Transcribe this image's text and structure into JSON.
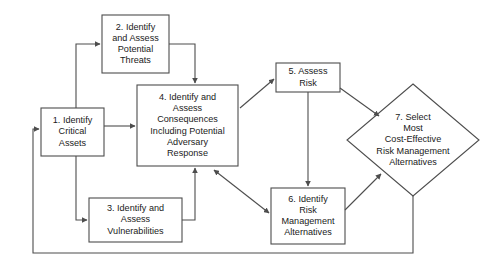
{
  "diagram": {
    "background_color": "#ffffff",
    "shape_stroke_color": "#4d4d4d",
    "text_color": "#1a1a1a",
    "nodes": [
      {
        "id": "node-1",
        "number": "1.",
        "name": "identify-critical-assets",
        "shape": "rectangle",
        "label": "1. Identify\nCritical\nAssets"
      },
      {
        "id": "node-2",
        "number": "2.",
        "name": "identify-assess-potential-threats",
        "shape": "rectangle",
        "label": "2. Identify\nand Assess\nPotential\nThreats"
      },
      {
        "id": "node-3",
        "number": "3.",
        "name": "identify-assess-vulnerabilities",
        "shape": "rectangle",
        "label": "3. Identify and\nAssess\nVulnerabilities"
      },
      {
        "id": "node-4",
        "number": "4.",
        "name": "identify-assess-consequences",
        "shape": "rectangle",
        "label": "4. Identify and\nAssess\nConsequences\nIncluding Potential\nAdversary\nResponse"
      },
      {
        "id": "node-5",
        "number": "5.",
        "name": "assess-risk",
        "shape": "rectangle",
        "label": "5. Assess\nRisk"
      },
      {
        "id": "node-6",
        "number": "6.",
        "name": "identify-risk-management-alternatives",
        "shape": "rectangle",
        "label": "6. Identify\nRisk\nManagement\nAlternatives"
      },
      {
        "id": "node-7",
        "number": "7.",
        "name": "select-most-cost-effective-alternatives",
        "shape": "diamond",
        "label": "7. Select\nMost\nCost-Effective\nRisk Management\nAlternatives"
      }
    ],
    "edges": [
      {
        "name": "edge-1-to-2",
        "from": "node-1",
        "to": "node-2",
        "arrows": "single"
      },
      {
        "name": "edge-1-to-4",
        "from": "node-1",
        "to": "node-4",
        "arrows": "single"
      },
      {
        "name": "edge-1-to-3",
        "from": "node-1",
        "to": "node-3",
        "arrows": "single"
      },
      {
        "name": "edge-2-to-4",
        "from": "node-2",
        "to": "node-4",
        "arrows": "single"
      },
      {
        "name": "edge-3-to-4",
        "from": "node-3",
        "to": "node-4",
        "arrows": "single"
      },
      {
        "name": "edge-4-to-5",
        "from": "node-4",
        "to": "node-5",
        "arrows": "single"
      },
      {
        "name": "edge-4-to-6",
        "from": "node-4",
        "to": "node-6",
        "arrows": "double"
      },
      {
        "name": "edge-5-to-6",
        "from": "node-5",
        "to": "node-6",
        "arrows": "single"
      },
      {
        "name": "edge-5-to-7",
        "from": "node-5",
        "to": "node-7",
        "arrows": "single"
      },
      {
        "name": "edge-6-to-7",
        "from": "node-6",
        "to": "node-7",
        "arrows": "single"
      },
      {
        "name": "edge-7-to-1-feedback",
        "from": "node-7",
        "to": "node-1",
        "arrows": "single"
      }
    ]
  }
}
